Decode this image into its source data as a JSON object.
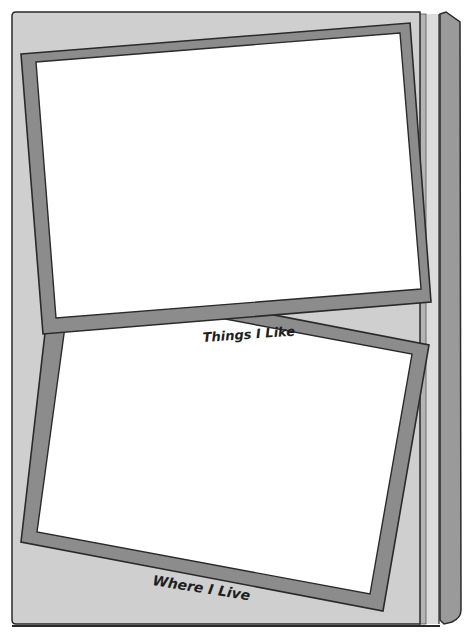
{
  "book": {
    "colors": {
      "page": "#cfcfcf",
      "frame": "#8c8c8c",
      "photo": "#ffffff",
      "outline": "#2a2a2a",
      "spine": "#9a9a9a",
      "edge_light": "#dcdcdc",
      "edge_mid": "#b4b4b4"
    }
  },
  "frames": [
    {
      "id": "top",
      "caption": "Things I Like"
    },
    {
      "id": "bottom",
      "caption": "Where I Live"
    }
  ]
}
